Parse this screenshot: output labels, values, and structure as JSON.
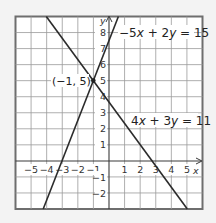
{
  "chart_data": {
    "type": "line",
    "title": "",
    "xlabel": "x",
    "ylabel": "y",
    "xlim": [
      -6,
      6
    ],
    "ylim": [
      -3,
      9
    ],
    "grid": true,
    "x_ticks": [
      "-5",
      "-4",
      "-3",
      "-2",
      "-1",
      "1",
      "2",
      "3",
      "4",
      "5"
    ],
    "y_ticks": [
      "-2",
      "-1",
      "1",
      "2",
      "3",
      "4",
      "5",
      "6",
      "7",
      "8"
    ],
    "series": [
      {
        "name": "-5x + 2y = 15",
        "equation": "y = (15 + 5x)/2",
        "points": [
          [
            -4.2,
            -3
          ],
          [
            0.6,
            9
          ]
        ]
      },
      {
        "name": "4x + 3y = 11",
        "equation": "y = (11 - 4x)/3",
        "points": [
          [
            -4,
            9
          ],
          [
            5,
            -3
          ]
        ]
      }
    ],
    "annotations": [
      {
        "text": "(-1, 5)",
        "x": -1,
        "y": 5,
        "type": "intersection-point"
      },
      {
        "text": "-5x + 2y = 15",
        "anchor": "top-right"
      },
      {
        "text": "4x + 3y = 11",
        "anchor": "right-middle"
      }
    ]
  },
  "labels": {
    "x_axis": "x",
    "y_axis": "y",
    "x_ticks": [
      {
        "v": -5,
        "t": "−5"
      },
      {
        "v": -4,
        "t": "−4"
      },
      {
        "v": -3,
        "t": "−3"
      },
      {
        "v": -2,
        "t": "−2"
      },
      {
        "v": -1,
        "t": "−1"
      },
      {
        "v": 1,
        "t": "1"
      },
      {
        "v": 2,
        "t": "2"
      },
      {
        "v": 3,
        "t": "3"
      },
      {
        "v": 4,
        "t": "4"
      },
      {
        "v": 5,
        "t": "5"
      }
    ],
    "y_ticks": [
      {
        "v": -2,
        "t": "−2"
      },
      {
        "v": -1,
        "t": "−1"
      },
      {
        "v": 1,
        "t": "1"
      },
      {
        "v": 2,
        "t": "2"
      },
      {
        "v": 3,
        "t": "3"
      },
      {
        "v": 4,
        "t": "4"
      },
      {
        "v": 5,
        "t": "5"
      },
      {
        "v": 6,
        "t": "6"
      },
      {
        "v": 7,
        "t": "7"
      },
      {
        "v": 8,
        "t": "8"
      }
    ],
    "eq1": {
      "c1": "−5",
      "v1": "x",
      "op": " + 2",
      "v2": "y",
      "rhs": " = 15"
    },
    "eq2": {
      "c1": "4",
      "v1": "x",
      "op": " + 3",
      "v2": "y",
      "rhs": " = 11"
    },
    "point": "(−1, 5)"
  }
}
